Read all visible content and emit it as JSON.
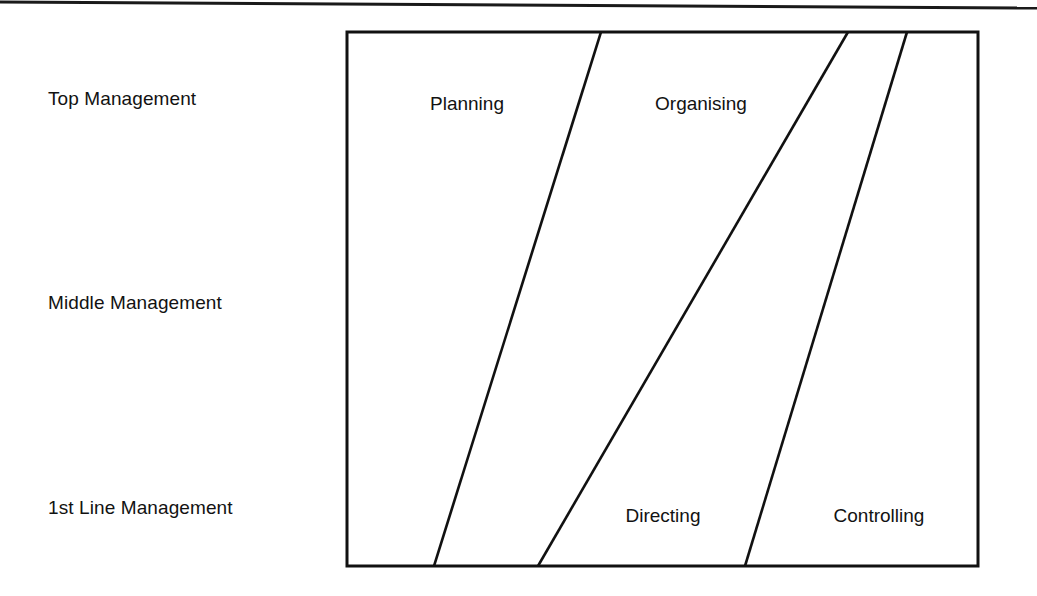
{
  "page": {
    "width": 1037,
    "height": 596,
    "background": "#ffffff",
    "ink_color": "#111111"
  },
  "header_rule": {
    "name": "page-header-rule",
    "left_y": 2,
    "right_y": 8,
    "thickness": 3
  },
  "tier_labels": [
    {
      "id": "top-management",
      "text": "Top Management",
      "x": 48,
      "y": 99
    },
    {
      "id": "middle-management",
      "text": "Middle Management",
      "x": 48,
      "y": 303
    },
    {
      "id": "first-line-management",
      "text": "1st Line Management",
      "x": 48,
      "y": 508
    }
  ],
  "diagram": {
    "name": "management-functions-diagram",
    "frame": {
      "x": 347,
      "y": 32,
      "width": 631,
      "height": 534,
      "stroke": "#111111",
      "stroke_width": 3
    },
    "dividers": [
      {
        "id": "planning-organising-divider",
        "x_top": 601,
        "y_top": 32,
        "x_bottom": 434,
        "y_bottom": 566
      },
      {
        "id": "organising-directing-divider",
        "x_top": 848,
        "y_top": 32,
        "x_bottom": 538,
        "y_bottom": 566
      },
      {
        "id": "directing-controlling-divider",
        "x_top": 907,
        "y_top": 32,
        "x_bottom": 745,
        "y_bottom": 566
      }
    ],
    "functions": [
      {
        "id": "planning",
        "text": "Planning",
        "x": 467,
        "y": 103
      },
      {
        "id": "organising",
        "text": "Organising",
        "x": 701,
        "y": 103
      },
      {
        "id": "directing",
        "text": "Directing",
        "x": 663,
        "y": 515
      },
      {
        "id": "controlling",
        "text": "Controlling",
        "x": 879,
        "y": 515
      }
    ]
  },
  "chart_data": {
    "type": "area",
    "xlabel": "Proportion of time spent",
    "ylabel": "Management level",
    "grid": false,
    "legend": "none",
    "categories": [
      "Top Management",
      "Middle Management",
      "1st Line Management"
    ],
    "series": [
      {
        "name": "Planning",
        "values": [
          40,
          28,
          14
        ]
      },
      {
        "name": "Organising",
        "values": [
          39,
          33,
          16
        ]
      },
      {
        "name": "Directing",
        "values": [
          9,
          25,
          33
        ]
      },
      {
        "name": "Controlling",
        "values": [
          12,
          14,
          37
        ]
      }
    ]
  }
}
